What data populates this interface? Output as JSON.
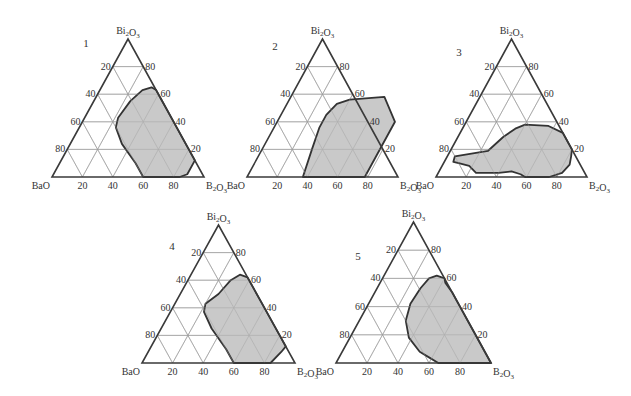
{
  "figure": {
    "components": {
      "left": "BaO",
      "right": "B₂O₃",
      "top": "Bi₂O₃"
    },
    "colors": {
      "region_fill": "#c9c9c9",
      "region_stroke": "#333333",
      "edge": "#3a3a3a",
      "grid": "#9a9a9a"
    }
  },
  "chart_data": [
    {
      "type": "ternary",
      "panel": "1",
      "vertices": {
        "bottom_left": "BaO",
        "bottom_right": "B₂O₃",
        "top": "Bi₂O₃"
      },
      "bottom_ticks": [
        "20",
        "40",
        "60",
        "80"
      ],
      "left_ticks": [
        "20",
        "40",
        "60",
        "80"
      ],
      "right_ticks": [
        "80",
        "60",
        "40",
        "20"
      ],
      "region_description": "Glass-forming region (shaded), points as [B2O3 %, Bi2O3 %]",
      "region": [
        [
          60,
          0
        ],
        [
          84,
          0
        ],
        [
          88,
          2
        ],
        [
          88,
          12
        ],
        [
          80,
          20
        ],
        [
          70,
          30
        ],
        [
          57,
          43
        ],
        [
          44,
          56
        ],
        [
          37,
          63
        ],
        [
          33,
          65
        ],
        [
          28,
          63
        ],
        [
          24,
          55
        ],
        [
          22,
          43
        ],
        [
          24,
          36
        ],
        [
          34,
          24
        ],
        [
          50,
          10
        ]
      ]
    },
    {
      "type": "ternary",
      "panel": "2",
      "vertices": {
        "bottom_left": "BaO",
        "bottom_right": "B₂O₃",
        "top": "Bi₂O₃"
      },
      "bottom_ticks": [
        "20",
        "40",
        "60",
        "80"
      ],
      "left_ticks": [
        "20",
        "40",
        "60",
        "80"
      ],
      "right_ticks": [
        "80",
        "60",
        "40",
        "20"
      ],
      "region_description": "Glass-forming region (shaded), points as [B2O3 %, Bi2O3 %]",
      "region": [
        [
          40,
          0
        ],
        [
          78,
          0
        ],
        [
          78,
          40
        ],
        [
          70,
          49
        ],
        [
          62,
          58
        ],
        [
          40,
          56
        ],
        [
          33,
          53
        ],
        [
          30,
          45
        ],
        [
          30,
          36
        ],
        [
          33,
          20
        ],
        [
          37,
          0
        ]
      ]
    },
    {
      "type": "ternary",
      "panel": "3",
      "vertices": {
        "bottom_left": "BaO",
        "bottom_right": "B₂O₃",
        "top": "Bi₂O₃"
      },
      "bottom_ticks": [
        "20",
        "40",
        "60",
        "80"
      ],
      "left_ticks": [
        "20",
        "40",
        "60",
        "80"
      ],
      "right_ticks": [
        "80",
        "60",
        "40",
        "20"
      ],
      "region_description": "Glass-forming region (shaded), points as [B2O3 %, Bi2O3 %]",
      "region": [
        [
          59,
          0
        ],
        [
          75,
          0
        ],
        [
          82,
          3
        ],
        [
          84,
          9
        ],
        [
          82,
          15
        ],
        [
          80,
          20
        ],
        [
          68,
          32
        ],
        [
          56,
          37
        ],
        [
          40,
          38
        ],
        [
          35,
          35
        ],
        [
          30,
          29
        ],
        [
          25,
          19
        ],
        [
          15,
          17
        ],
        [
          5,
          15
        ],
        [
          6,
          11
        ],
        [
          10,
          10
        ],
        [
          18,
          8
        ],
        [
          25,
          3
        ],
        [
          40,
          3
        ],
        [
          48,
          4
        ],
        [
          55,
          2
        ]
      ]
    },
    {
      "type": "ternary",
      "panel": "4",
      "vertices": {
        "bottom_left": "BaO",
        "bottom_right": "B₂O₃",
        "top": "Bi₂O₃"
      },
      "bottom_ticks": [
        "20",
        "40",
        "60",
        "80"
      ],
      "left_ticks": [
        "20",
        "40",
        "60",
        "80"
      ],
      "right_ticks": [
        "80",
        "60",
        "40",
        "20"
      ],
      "region_description": "Glass-forming region (shaded), points as [B2O3 %, Bi2O3 %]",
      "region": [
        [
          60,
          0
        ],
        [
          84,
          0
        ],
        [
          87,
          8
        ],
        [
          88,
          12
        ],
        [
          80,
          20
        ],
        [
          70,
          30
        ],
        [
          57,
          43
        ],
        [
          45,
          55
        ],
        [
          38,
          62
        ],
        [
          32,
          64
        ],
        [
          28,
          60
        ],
        [
          25,
          50
        ],
        [
          20,
          43
        ],
        [
          22,
          37
        ],
        [
          33,
          25
        ],
        [
          50,
          10
        ]
      ]
    },
    {
      "type": "ternary",
      "panel": "5",
      "vertices": {
        "bottom_left": "BaO",
        "bottom_right": "B₂O₃",
        "top": "Bi₂O₃"
      },
      "bottom_ticks": [
        "20",
        "40",
        "60",
        "80"
      ],
      "left_ticks": [
        "20",
        "40",
        "60",
        "80"
      ],
      "right_ticks": [
        "80",
        "60",
        "40",
        "20"
      ],
      "region_description": "Glass-forming region (shaded), points as [B2O3 %, Bi2O3 %]",
      "region": [
        [
          66,
          0
        ],
        [
          100,
          0
        ],
        [
          80,
          20
        ],
        [
          70,
          30
        ],
        [
          60,
          40
        ],
        [
          50,
          50
        ],
        [
          42,
          57
        ],
        [
          40,
          60
        ],
        [
          34,
          62
        ],
        [
          30,
          60
        ],
        [
          28,
          53
        ],
        [
          27,
          42
        ],
        [
          30,
          30
        ],
        [
          38,
          18
        ],
        [
          50,
          8
        ],
        [
          58,
          4
        ]
      ]
    }
  ],
  "layout": {
    "panels": [
      {
        "id": "1",
        "left": 52,
        "right": 204,
        "base": 177,
        "apex_y": 39,
        "num_x": 86,
        "num_y": 47
      },
      {
        "id": "2",
        "left": 247,
        "right": 398,
        "base": 177,
        "apex_y": 39,
        "num_x": 275,
        "num_y": 50
      },
      {
        "id": "3",
        "left": 436,
        "right": 587,
        "base": 177,
        "apex_y": 39,
        "num_x": 459,
        "num_y": 56
      },
      {
        "id": "4",
        "left": 142,
        "right": 295,
        "base": 363,
        "apex_y": 225,
        "num_x": 172,
        "num_y": 250
      },
      {
        "id": "5",
        "left": 336,
        "right": 491,
        "base": 363,
        "apex_y": 222,
        "num_x": 358,
        "num_y": 260
      }
    ]
  }
}
